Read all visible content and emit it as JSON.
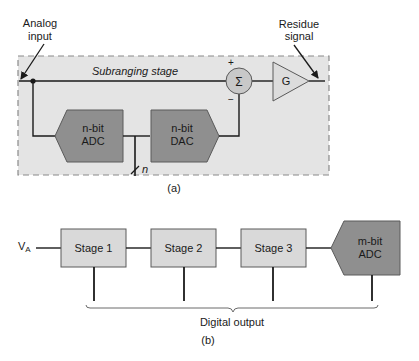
{
  "figure_a": {
    "caption": "(a)",
    "analog_input_label_line1": "Analog",
    "analog_input_label_line2": "input",
    "residue_label_line1": "Residue",
    "residue_label_line2": "signal",
    "stage_label": "Subranging stage",
    "adc_line1": "n-bit",
    "adc_line2": "ADC",
    "dac_line1": "n-bit",
    "dac_line2": "DAC",
    "summer_symbol": "Σ",
    "summer_plus": "+",
    "summer_minus": "−",
    "gain_label": "G",
    "bus_width_label": "n"
  },
  "figure_b": {
    "caption": "(b)",
    "input_label": "V",
    "input_subscript": "A",
    "stages": [
      {
        "label": "Stage 1"
      },
      {
        "label": "Stage 2"
      },
      {
        "label": "Stage 3"
      }
    ],
    "final_adc_line1": "m-bit",
    "final_adc_line2": "ADC",
    "output_label": "Digital output"
  },
  "colors": {
    "stage_background": "#e4e4e4",
    "dashed_border": "#8a8a8a",
    "converter_fill": "#8f8f8f",
    "stage_box_fill": "#d9d9d9",
    "summer_fill": "#c8c8c8",
    "gain_fill": "#dcdcdc",
    "line": "#1a1a1a"
  }
}
